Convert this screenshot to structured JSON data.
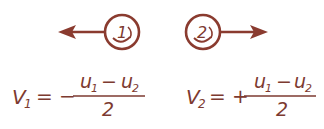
{
  "diagram": {
    "color": "#8a3b2f",
    "particles": [
      {
        "label": "1",
        "direction": "left"
      },
      {
        "label": "2",
        "direction": "right"
      }
    ],
    "formulas": [
      {
        "lhs_var": "V",
        "lhs_sub": "1",
        "op": "= −",
        "numerator": {
          "a": "u",
          "a_sub": "1",
          "minus": "−",
          "b": "u",
          "b_sub": "2"
        },
        "denominator": "2"
      },
      {
        "lhs_var": "V",
        "lhs_sub": "2",
        "op": "= +",
        "numerator": {
          "a": "u",
          "a_sub": "1",
          "minus": "−",
          "b": "u",
          "b_sub": "2"
        },
        "denominator": "2"
      }
    ]
  }
}
